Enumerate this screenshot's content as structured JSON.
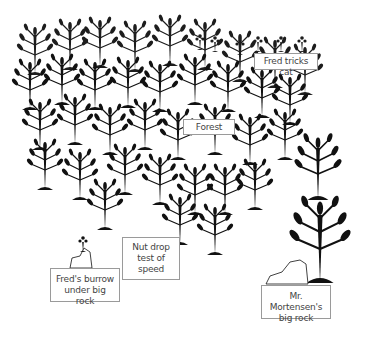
{
  "diagram": {
    "type": "illustration",
    "colors": {
      "ink": "#111111",
      "background": "#ffffff",
      "label_border": "#9a9a9a",
      "label_text": "#444444"
    },
    "labels": [
      {
        "id": "fred-tricks-cat",
        "text": "Fred tricks cat",
        "box": [
          254,
          53,
          64,
          17
        ]
      },
      {
        "id": "forest",
        "text": "Forest",
        "box": [
          183,
          119,
          52,
          16
        ]
      },
      {
        "id": "nut-drop",
        "text": "Nut drop test of speed",
        "lines": [
          "Nut drop",
          "test of",
          "speed"
        ],
        "box": [
          122,
          237,
          58,
          43
        ]
      },
      {
        "id": "freds-burrow",
        "text": "Fred's burrow under big rock",
        "lines": [
          "Fred's burrow",
          "under big rock"
        ],
        "box": [
          50,
          268,
          70,
          34
        ]
      },
      {
        "id": "mortensen-rock",
        "text": "Mr. Mortensen's big rock",
        "lines": [
          "Mr. Mortensen's",
          "big rock"
        ],
        "box": [
          261,
          285,
          70,
          34
        ]
      }
    ]
  }
}
